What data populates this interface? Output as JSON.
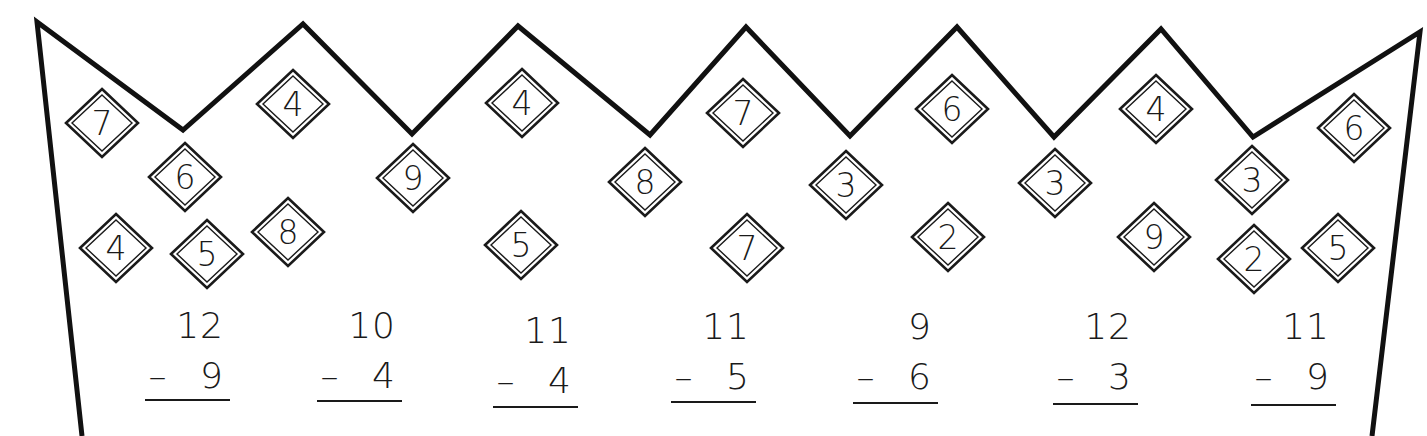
{
  "colors": {
    "background": "#ffffff",
    "ink": "#1a1a1a",
    "outline": "#111111"
  },
  "crown": {
    "outline_points": [
      [
        82,
        436
      ],
      [
        37,
        22
      ],
      [
        183,
        130
      ],
      [
        303,
        24
      ],
      [
        412,
        134
      ],
      [
        518,
        26
      ],
      [
        650,
        135
      ],
      [
        746,
        27
      ],
      [
        850,
        136
      ],
      [
        957,
        27
      ],
      [
        1054,
        137
      ],
      [
        1161,
        29
      ],
      [
        1253,
        137
      ],
      [
        1420,
        32
      ],
      [
        1372,
        436
      ]
    ]
  },
  "diamonds": [
    {
      "value": "7",
      "x": 102,
      "y": 123
    },
    {
      "value": "6",
      "x": 185,
      "y": 177
    },
    {
      "value": "4",
      "x": 116,
      "y": 248
    },
    {
      "value": "5",
      "x": 207,
      "y": 254
    },
    {
      "value": "8",
      "x": 288,
      "y": 232
    },
    {
      "value": "4",
      "x": 293,
      "y": 104
    },
    {
      "value": "9",
      "x": 413,
      "y": 178
    },
    {
      "value": "4",
      "x": 522,
      "y": 103
    },
    {
      "value": "5",
      "x": 521,
      "y": 245
    },
    {
      "value": "8",
      "x": 645,
      "y": 182
    },
    {
      "value": "7",
      "x": 743,
      "y": 113
    },
    {
      "value": "7",
      "x": 747,
      "y": 248
    },
    {
      "value": "3",
      "x": 846,
      "y": 185
    },
    {
      "value": "6",
      "x": 952,
      "y": 109
    },
    {
      "value": "2",
      "x": 948,
      "y": 237
    },
    {
      "value": "3",
      "x": 1055,
      "y": 183
    },
    {
      "value": "4",
      "x": 1156,
      "y": 109
    },
    {
      "value": "9",
      "x": 1154,
      "y": 237
    },
    {
      "value": "3",
      "x": 1252,
      "y": 180
    },
    {
      "value": "2",
      "x": 1254,
      "y": 259
    },
    {
      "value": "6",
      "x": 1354,
      "y": 128
    },
    {
      "value": "5",
      "x": 1338,
      "y": 248
    }
  ],
  "problems": [
    {
      "minuend": "12",
      "subtrahend": "9",
      "operator": "–",
      "x": 190,
      "top_y": 338,
      "bottom_y": 388,
      "line_y": 400
    },
    {
      "minuend": "10",
      "subtrahend": "4",
      "operator": "–",
      "x": 362,
      "top_y": 338,
      "bottom_y": 388,
      "line_y": 401
    },
    {
      "minuend": "11",
      "subtrahend": "4",
      "operator": "–",
      "x": 538,
      "top_y": 343,
      "bottom_y": 393,
      "line_y": 407
    },
    {
      "minuend": "11",
      "subtrahend": "5",
      "operator": "–",
      "x": 716,
      "top_y": 339,
      "bottom_y": 389,
      "line_y": 402
    },
    {
      "minuend": "9",
      "subtrahend": "6",
      "operator": "–",
      "x": 898,
      "top_y": 339,
      "bottom_y": 389,
      "line_y": 403
    },
    {
      "minuend": "12",
      "subtrahend": "3",
      "operator": "–",
      "x": 1098,
      "top_y": 339,
      "bottom_y": 389,
      "line_y": 404
    },
    {
      "minuend": "11",
      "subtrahend": "9",
      "operator": "–",
      "x": 1296,
      "top_y": 339,
      "bottom_y": 389,
      "line_y": 405
    }
  ]
}
